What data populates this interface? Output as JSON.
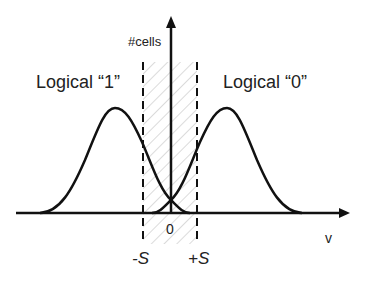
{
  "diagram": {
    "y_axis_label": "#cells",
    "x_axis_label": "v",
    "origin_label": "0",
    "left_distribution_label": "Logical “1”",
    "right_distribution_label": "Logical “0”",
    "left_threshold_label": "-S",
    "right_threshold_label": "+S",
    "colors": {
      "line": "#111111",
      "hatch": "#c8c8c8",
      "text": "#222222"
    }
  }
}
